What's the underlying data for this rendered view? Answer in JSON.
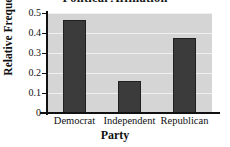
{
  "chart_data": {
    "type": "bar",
    "title": "Political Affiliation",
    "xlabel": "Party",
    "ylabel": "Relative Frequency",
    "categories": [
      "Democrat",
      "Independent",
      "Republican"
    ],
    "values": [
      0.465,
      0.162,
      0.375
    ],
    "ylim": [
      0,
      0.5
    ],
    "yticks": [
      0,
      0.1,
      0.2,
      0.3,
      0.4,
      0.5
    ],
    "ytick_labels": [
      "0",
      "0.1",
      "0.2",
      "0.3",
      "0.4",
      "0.5"
    ],
    "grid": true,
    "legend": false,
    "colors": {
      "bar": "#3b3b3b",
      "bar_edge": "#202020",
      "plot_background": "#d5d5d5",
      "figure_background": "#ffffff",
      "gridline": "#f0f0f0",
      "axis": "#111111",
      "text": "#111111"
    }
  }
}
